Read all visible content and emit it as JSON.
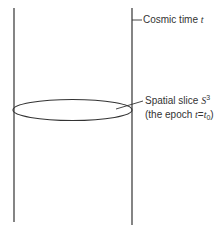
{
  "diagram": {
    "type": "spacetime-cylinder",
    "colors": {
      "stroke": "#333333",
      "text": "#333333",
      "background": "#ffffff"
    },
    "labels": {
      "time_axis": {
        "text": "Cosmic time ",
        "var": "t"
      },
      "slice": {
        "line1_text": "Spatial slice ",
        "line1_var": "S",
        "line1_sup": "3",
        "line2_open": "(the epoch ",
        "line2_var": "t",
        "line2_eq": "=",
        "line2_var2": "t",
        "line2_sub": "0",
        "line2_close": ")"
      }
    }
  }
}
